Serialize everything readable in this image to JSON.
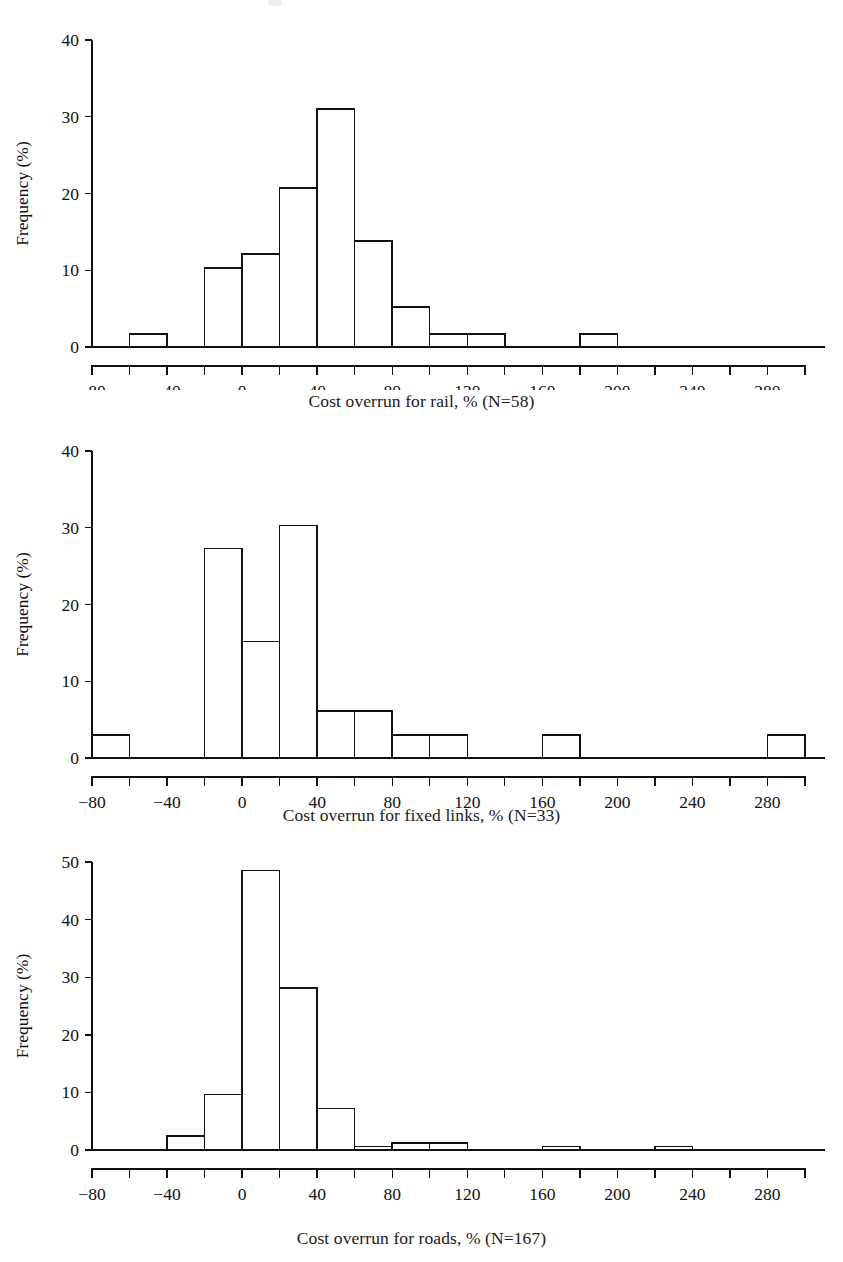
{
  "figure": {
    "background": "#ffffff",
    "ink": "#111111",
    "panel_count": 3
  },
  "chart_data": [
    {
      "type": "bar",
      "subtype": "histogram",
      "title": "",
      "xlabel": "Cost overrun for rail, % (N=58)",
      "ylabel": "Frequency (%)",
      "n": 58,
      "xlim": [
        -80,
        300
      ],
      "ylim": [
        0,
        40
      ],
      "grid": false,
      "legend": null,
      "bin_width": 20,
      "xticks": [
        -80,
        -40,
        0,
        40,
        80,
        120,
        160,
        200,
        240,
        280
      ],
      "xtick_labels": [
        "−80",
        "−40",
        "0",
        "40",
        "80",
        "120",
        "160",
        "200",
        "240",
        "280"
      ],
      "xminorticks": [
        -60,
        -20,
        20,
        60,
        100,
        140,
        180,
        220,
        260,
        300
      ],
      "yticks": [
        0,
        10,
        20,
        30,
        40
      ],
      "ytick_labels": [
        "0",
        "10",
        "20",
        "30",
        "40"
      ],
      "bins": [
        {
          "x0": -60,
          "x1": -40,
          "value": 1.7
        },
        {
          "x0": -20,
          "x1": 0,
          "value": 10.3
        },
        {
          "x0": 0,
          "x1": 20,
          "value": 12.1
        },
        {
          "x0": 20,
          "x1": 40,
          "value": 20.7
        },
        {
          "x0": 40,
          "x1": 60,
          "value": 31.0
        },
        {
          "x0": 60,
          "x1": 80,
          "value": 13.8
        },
        {
          "x0": 80,
          "x1": 100,
          "value": 5.2
        },
        {
          "x0": 100,
          "x1": 120,
          "value": 1.7
        },
        {
          "x0": 120,
          "x1": 140,
          "value": 1.7
        },
        {
          "x0": 180,
          "x1": 200,
          "value": 1.7
        }
      ]
    },
    {
      "type": "bar",
      "subtype": "histogram",
      "title": "",
      "xlabel": "Cost overrun for fixed links, % (N=33)",
      "ylabel": "Frequency (%)",
      "n": 33,
      "xlim": [
        -80,
        300
      ],
      "ylim": [
        0,
        40
      ],
      "grid": false,
      "legend": null,
      "bin_width": 20,
      "xticks": [
        -80,
        -40,
        0,
        40,
        80,
        120,
        160,
        200,
        240,
        280
      ],
      "xtick_labels": [
        "−80",
        "−40",
        "0",
        "40",
        "80",
        "120",
        "160",
        "200",
        "240",
        "280"
      ],
      "xminorticks": [
        -60,
        -20,
        20,
        60,
        100,
        140,
        180,
        220,
        260,
        300
      ],
      "yticks": [
        0,
        10,
        20,
        30,
        40
      ],
      "ytick_labels": [
        "0",
        "10",
        "20",
        "30",
        "40"
      ],
      "bins": [
        {
          "x0": -80,
          "x1": -60,
          "value": 3.0
        },
        {
          "x0": -20,
          "x1": 0,
          "value": 27.3
        },
        {
          "x0": 0,
          "x1": 20,
          "value": 15.2
        },
        {
          "x0": 20,
          "x1": 40,
          "value": 30.3
        },
        {
          "x0": 40,
          "x1": 60,
          "value": 6.1
        },
        {
          "x0": 60,
          "x1": 80,
          "value": 6.1
        },
        {
          "x0": 80,
          "x1": 100,
          "value": 3.0
        },
        {
          "x0": 100,
          "x1": 120,
          "value": 3.0
        },
        {
          "x0": 160,
          "x1": 180,
          "value": 3.0
        },
        {
          "x0": 280,
          "x1": 300,
          "value": 3.0
        }
      ]
    },
    {
      "type": "bar",
      "subtype": "histogram",
      "title": "",
      "xlabel": "Cost overrun for roads, % (N=167)",
      "ylabel": "Frequency (%)",
      "n": 167,
      "xlim": [
        -80,
        300
      ],
      "ylim": [
        0,
        50
      ],
      "grid": false,
      "legend": null,
      "bin_width": 20,
      "xticks": [
        -80,
        -40,
        0,
        40,
        80,
        120,
        160,
        200,
        240,
        280
      ],
      "xtick_labels": [
        "−80",
        "−40",
        "0",
        "40",
        "80",
        "120",
        "160",
        "200",
        "240",
        "280"
      ],
      "xminorticks": [
        -60,
        -20,
        20,
        60,
        100,
        140,
        180,
        220,
        260,
        300
      ],
      "yticks": [
        0,
        10,
        20,
        30,
        40,
        50
      ],
      "ytick_labels": [
        "0",
        "10",
        "20",
        "30",
        "40",
        "50"
      ],
      "bins": [
        {
          "x0": -40,
          "x1": -20,
          "value": 2.4
        },
        {
          "x0": -20,
          "x1": 0,
          "value": 9.6
        },
        {
          "x0": 0,
          "x1": 20,
          "value": 48.5
        },
        {
          "x0": 20,
          "x1": 40,
          "value": 28.1
        },
        {
          "x0": 40,
          "x1": 60,
          "value": 7.2
        },
        {
          "x0": 60,
          "x1": 80,
          "value": 0.6
        },
        {
          "x0": 80,
          "x1": 100,
          "value": 1.2
        },
        {
          "x0": 100,
          "x1": 120,
          "value": 1.2
        },
        {
          "x0": 160,
          "x1": 180,
          "value": 0.6
        },
        {
          "x0": 220,
          "x1": 240,
          "value": 0.6
        }
      ]
    }
  ]
}
